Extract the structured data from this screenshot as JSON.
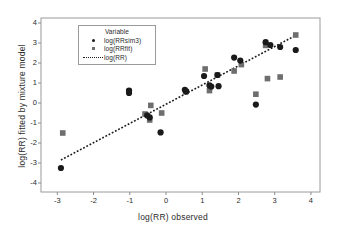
{
  "chart_data": {
    "type": "scatter",
    "title": "",
    "xlabel": "log(RR) observed",
    "ylabel": "log(RR) fitted by mixture model",
    "xlim": [
      -3.45,
      4.25
    ],
    "ylim": [
      -4.45,
      4.25
    ],
    "xticks": [
      -3,
      -2,
      -1,
      0,
      1,
      2,
      3,
      4
    ],
    "yticks": [
      -4,
      -3,
      -2,
      -1,
      0,
      1,
      2,
      3,
      4
    ],
    "xticklabels": [
      "-3",
      "-2",
      "-1",
      "0",
      "1",
      "2",
      "3",
      "4"
    ],
    "yticklabels": [
      "4",
      "3",
      "2",
      "1",
      "0",
      "-1",
      "-2",
      "-3",
      "-4"
    ],
    "grid": false,
    "legend_position": "upper-left-inside",
    "legend_title": "Variable",
    "series": [
      {
        "name": "log(RRsim3)",
        "marker": "circle",
        "color": "#1a1a1a",
        "points": [
          [
            -2.9,
            -3.25
          ],
          [
            -1.02,
            0.62
          ],
          [
            -1.02,
            0.5
          ],
          [
            -0.52,
            -0.62
          ],
          [
            -0.45,
            -0.72
          ],
          [
            -0.15,
            -1.47
          ],
          [
            0.52,
            0.66
          ],
          [
            0.56,
            0.58
          ],
          [
            1.05,
            1.35
          ],
          [
            1.2,
            0.88
          ],
          [
            1.25,
            0.82
          ],
          [
            1.45,
            0.84
          ],
          [
            1.42,
            1.4
          ],
          [
            1.88,
            2.27
          ],
          [
            2.05,
            2.12
          ],
          [
            2.48,
            -0.08
          ],
          [
            2.75,
            3.04
          ],
          [
            2.88,
            2.9
          ],
          [
            3.15,
            2.8
          ],
          [
            3.58,
            2.65
          ]
        ]
      },
      {
        "name": "log(RRfit)",
        "marker": "square",
        "color": "#6e6e6e",
        "points": [
          [
            -2.85,
            -1.5
          ],
          [
            -1.02,
            0.58
          ],
          [
            -0.58,
            -0.55
          ],
          [
            -0.45,
            -0.85
          ],
          [
            -0.42,
            -0.12
          ],
          [
            -0.12,
            -0.5
          ],
          [
            0.54,
            0.56
          ],
          [
            1.08,
            1.7
          ],
          [
            1.2,
            0.62
          ],
          [
            1.42,
            1.4
          ],
          [
            1.88,
            1.6
          ],
          [
            2.08,
            1.92
          ],
          [
            2.48,
            0.44
          ],
          [
            2.75,
            2.88
          ],
          [
            2.8,
            1.22
          ],
          [
            3.15,
            1.3
          ],
          [
            3.58,
            3.4
          ]
        ]
      },
      {
        "name": "log(RR)",
        "marker": "dashed-line",
        "color": "#1a1a1a",
        "line": [
          [
            -2.9,
            -2.85
          ],
          [
            3.6,
            3.4
          ]
        ]
      }
    ]
  },
  "legend": {
    "title": "Variable",
    "entries": [
      {
        "label": "log(RRsim3)",
        "key": "dot-marker"
      },
      {
        "label": "log(RRfit)",
        "key": "square-marker"
      },
      {
        "label": "log(RR)",
        "key": "dashed-line"
      }
    ]
  },
  "colors": {
    "circle": "#1a1a1a",
    "square": "#6e6e6e",
    "line": "#1a1a1a",
    "axis": "#8c8c8c",
    "text": "#2b2b2b",
    "background": "#ffffff"
  }
}
